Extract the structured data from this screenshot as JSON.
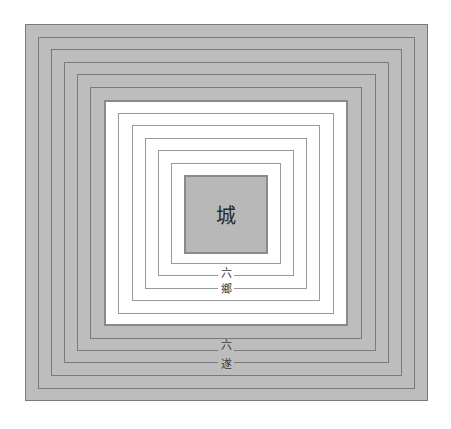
{
  "diagram": {
    "center_label": "城",
    "inner_zone_label": [
      "六",
      "鄉"
    ],
    "outer_zone_label": [
      "六",
      "遂"
    ],
    "inner_zone_name": "六鄉",
    "outer_zone_name": "六遂",
    "outer_rings": 6,
    "inner_rings": 6
  },
  "colors": {
    "outer_fill": "#bdbdbd",
    "core_fill": "#b8b8b8",
    "line": "#7a7a7a",
    "inner_zone_fill": "#ffffff"
  }
}
